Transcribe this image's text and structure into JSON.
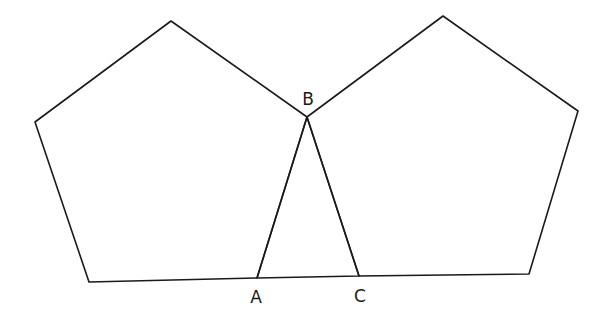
{
  "diagram": {
    "title": "",
    "stroke_color": "#1a1a1a",
    "background": "#ffffff",
    "shapes": [
      {
        "name": "left-pentagon",
        "type": "polygon",
        "vertices": [
          [
            171,
            21
          ],
          [
            307,
            117
          ],
          [
            257,
            278
          ],
          [
            89,
            282
          ],
          [
            35,
            122
          ]
        ]
      },
      {
        "name": "right-pentagon",
        "type": "polygon",
        "vertices": [
          [
            443,
            16
          ],
          [
            578,
            111
          ],
          [
            529,
            274
          ],
          [
            359,
            276
          ],
          [
            307,
            117
          ]
        ]
      },
      {
        "name": "triangle-abc",
        "type": "polygon",
        "vertices": [
          [
            257,
            278
          ],
          [
            307,
            117
          ],
          [
            359,
            276
          ]
        ]
      }
    ],
    "points": {
      "A": {
        "label": "A",
        "x": 257,
        "y": 278,
        "label_x": 256,
        "label_y": 298
      },
      "B": {
        "label": "B",
        "x": 307,
        "y": 117,
        "label_x": 308,
        "label_y": 100
      },
      "C": {
        "label": "C",
        "x": 359,
        "y": 276,
        "label_x": 360,
        "label_y": 297
      }
    }
  }
}
